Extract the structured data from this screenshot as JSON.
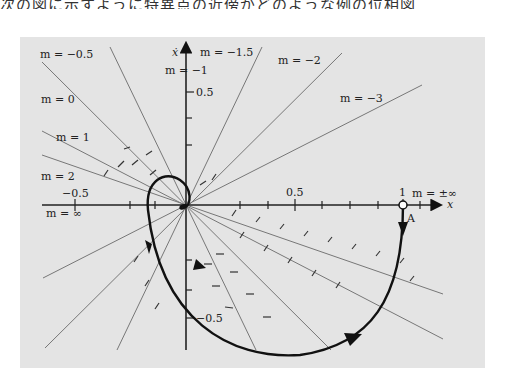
{
  "caption": "次の図に示すように特異点の近傍がどのような例の位相図",
  "diagram": {
    "type": "phase-plane isocline diagram",
    "x_axis_label": "x",
    "y_axis_label": "ẋ",
    "x_ticks": [
      "−0.5",
      "0.5",
      "1"
    ],
    "y_ticks": [
      "0.5",
      "−0.5"
    ],
    "point_label": "A",
    "isoclines": [
      {
        "id": "m0",
        "label": "m = 0"
      },
      {
        "id": "m_neg05",
        "label": "m = −0.5"
      },
      {
        "id": "m_neg1",
        "label": "m = −1"
      },
      {
        "id": "m_neg15",
        "label": "m = −1.5"
      },
      {
        "id": "m_neg2",
        "label": "m = −2"
      },
      {
        "id": "m_neg3",
        "label": "m = −3"
      },
      {
        "id": "m1",
        "label": "m = 1"
      },
      {
        "id": "m2",
        "label": "m = 2"
      },
      {
        "id": "m_inf",
        "label": "m = ∞"
      },
      {
        "id": "m_pminf",
        "label": "m = ±∞"
      }
    ],
    "colors": {
      "panel": "#e4e4e4",
      "isocline": "#777777",
      "axis": "#222222",
      "trajectory": "#111111"
    }
  }
}
